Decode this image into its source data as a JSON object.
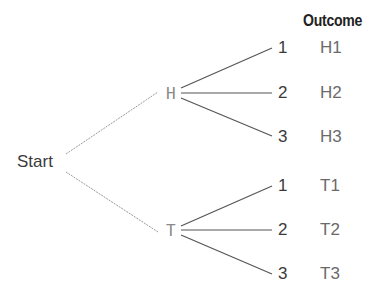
{
  "diagram": {
    "type": "tree-diagram",
    "header": "Outcome",
    "root": {
      "label": "Start"
    },
    "level1": [
      {
        "label": "H",
        "children": [
          "1",
          "2",
          "3"
        ],
        "outcomes": [
          "H1",
          "H2",
          "H3"
        ]
      },
      {
        "label": "T",
        "children": [
          "1",
          "2",
          "3"
        ],
        "outcomes": [
          "T1",
          "T2",
          "T3"
        ]
      }
    ],
    "colors": {
      "line_dark": "#555555",
      "line_dashed": "#9a9a9a",
      "text": "#3a3a3a"
    }
  }
}
